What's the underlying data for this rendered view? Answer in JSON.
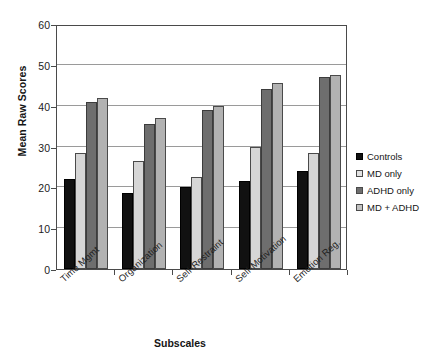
{
  "chart_data": {
    "type": "bar",
    "title": "",
    "xlabel": "Subscales",
    "ylabel": "Mean Raw Scores",
    "ylim": [
      0,
      60
    ],
    "yticks": [
      0,
      10,
      20,
      30,
      40,
      50,
      60
    ],
    "grid": true,
    "legend_position": "right",
    "categories": [
      "Time Mgmt",
      "Organization",
      "Self-Restraint",
      "Self-Motivation",
      "Emotion Reg."
    ],
    "series": [
      {
        "name": "Controls",
        "color": "#111111",
        "values": [
          22.0,
          18.5,
          20.0,
          21.5,
          24.0
        ]
      },
      {
        "name": "MD only",
        "color": "#d6d6d6",
        "values": [
          28.5,
          26.5,
          22.5,
          30.0,
          28.5
        ]
      },
      {
        "name": "ADHD only",
        "color": "#6e6e6e",
        "values": [
          41.0,
          35.5,
          39.0,
          44.0,
          47.0
        ]
      },
      {
        "name": "MD + ADHD",
        "color": "#b2b2b2",
        "values": [
          42.0,
          37.0,
          40.0,
          45.5,
          47.5
        ]
      }
    ]
  },
  "axes": {
    "y_title": "Mean Raw Scores",
    "x_title": "Subscales",
    "y_tick_labels": [
      "0",
      "10",
      "20",
      "30",
      "40",
      "50",
      "60"
    ],
    "x_tick_labels": [
      "Time Mgmt",
      "Organization",
      "Self-Restraint",
      "Self-Motivation",
      "Emotion Reg."
    ]
  },
  "legend": {
    "items": [
      {
        "label": "Controls"
      },
      {
        "label": "MD only"
      },
      {
        "label": "ADHD only"
      },
      {
        "label": "MD + ADHD"
      }
    ]
  }
}
